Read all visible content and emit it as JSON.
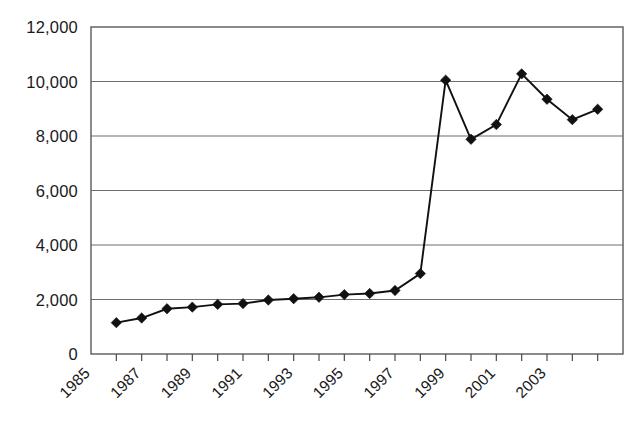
{
  "chart_data": {
    "type": "line",
    "title": "",
    "subtitle": "",
    "xlabel": "",
    "ylabel": "",
    "x": [
      1986,
      1987,
      1988,
      1989,
      1990,
      1991,
      1992,
      1993,
      1994,
      1995,
      1996,
      1997,
      1998,
      1999,
      2000,
      2001,
      2002,
      2003,
      2004,
      2005
    ],
    "values": [
      1150,
      1320,
      1660,
      1720,
      1820,
      1850,
      1980,
      2030,
      2080,
      2180,
      2220,
      2330,
      2950,
      10050,
      7880,
      8420,
      10280,
      9350,
      8600,
      8980
    ],
    "series": [
      {
        "name": "",
        "values": [
          1150,
          1320,
          1660,
          1720,
          1820,
          1850,
          1980,
          2030,
          2080,
          2180,
          2220,
          2330,
          2950,
          10050,
          7880,
          8420,
          10280,
          9350,
          8600,
          8980
        ]
      }
    ],
    "xlim": [
      1985,
      2006
    ],
    "ylim": [
      0,
      12000
    ],
    "ytick_values": [
      0,
      2000,
      4000,
      6000,
      8000,
      10000,
      12000
    ],
    "ytick_labels": [
      "0",
      "2,000",
      "4,000",
      "6,000",
      "8,000",
      "10,000",
      "12,000"
    ],
    "xtick_values": [
      1985,
      1987,
      1989,
      1991,
      1993,
      1995,
      1997,
      1999,
      2001,
      2003
    ],
    "xtick_labels": [
      "1985",
      "1987",
      "1989",
      "1991",
      "1993",
      "1995",
      "1997",
      "1999",
      "2001",
      "2003"
    ],
    "xtick_all_values": [
      1985,
      1986,
      1987,
      1988,
      1989,
      1990,
      1991,
      1992,
      1993,
      1994,
      1995,
      1996,
      1997,
      1998,
      1999,
      2000,
      2001,
      2002,
      2003,
      2004,
      2005,
      2006
    ],
    "xtick_label_rotation": -45,
    "grid": "horizontal",
    "legend": "none",
    "marker": "diamond",
    "marker_color": "#111111",
    "line_color": "#111111",
    "gridline_color": "#6e6e6e",
    "frame_color": "#5a5a5a",
    "background_color": "#ffffff",
    "annotations": []
  }
}
